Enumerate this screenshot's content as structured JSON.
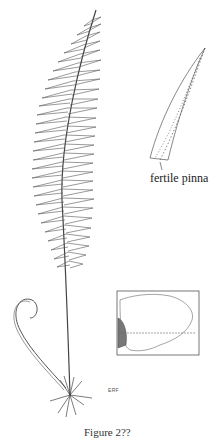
{
  "illustration": {
    "subject": "fern frond with crozier, rhizome and roots",
    "inset_label": "fertile pinna",
    "map": {
      "description": "range map of North America",
      "highlight": "Pacific Northwest coast (hatched)"
    },
    "artist_monogram": "ERF",
    "caption": "Figure 2??"
  },
  "colors": {
    "ink": "#333333",
    "background": "#ffffff",
    "map_hatch": "#555555"
  }
}
